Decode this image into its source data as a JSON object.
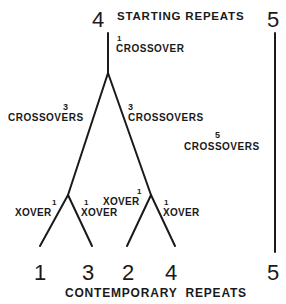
{
  "title": {
    "start_left": "4",
    "start_label": "STARTING REPEATS",
    "start_right": "5"
  },
  "top_edge": {
    "count": "1",
    "label": "CROSSOVER"
  },
  "branches": {
    "left_main": {
      "count": "3",
      "label": "CROSSOVERS"
    },
    "right_main": {
      "count": "3",
      "label": "CROSSOVERS"
    },
    "independent": {
      "count": "5",
      "label": "CROSSOVERS"
    },
    "sub_left_a": {
      "count": "1",
      "label": "XOVER"
    },
    "sub_left_b": {
      "count": "1",
      "label": "XOVER"
    },
    "sub_right_a": {
      "count": "1",
      "label": "XOVER"
    },
    "sub_right_b": {
      "count": "1",
      "label": "XOVER"
    }
  },
  "leaves": [
    "1",
    "3",
    "2",
    "4",
    "5"
  ],
  "footer": {
    "label": "CONTEMPORARY  REPEATS"
  },
  "colors": {
    "ink": "#1a1a1a",
    "background": "#ffffff"
  }
}
